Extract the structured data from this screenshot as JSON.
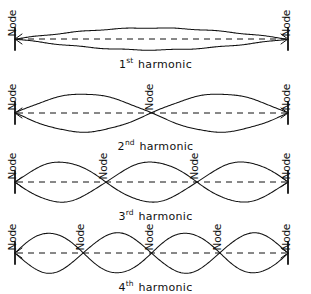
{
  "figure": {
    "background_color": "#ffffff",
    "ink_color": "#111111",
    "node_label_text": "Node"
  },
  "chart_data": {
    "type": "line",
    "xlabel": "",
    "ylabel": "",
    "xlim": [
      0,
      1
    ],
    "ylim": [
      -1,
      1
    ],
    "grid": false,
    "legend": "none",
    "annotations": [
      "Node",
      "1st harmonic",
      "2nd harmonic",
      "3rd harmonic",
      "4th harmonic"
    ],
    "series": [
      {
        "name": "1st harmonic",
        "harmonic_number": 1,
        "antinodes": 1,
        "nodes": 2,
        "node_positions_fraction": [
          0,
          1
        ],
        "amplitude_relative": 0.38,
        "waveform": "sin(1*pi*x)"
      },
      {
        "name": "2nd harmonic",
        "harmonic_number": 2,
        "antinodes": 2,
        "nodes": 3,
        "node_positions_fraction": [
          0,
          0.5,
          1
        ],
        "amplitude_relative": 0.82,
        "waveform": "sin(2*pi*x)"
      },
      {
        "name": "3rd harmonic",
        "harmonic_number": 3,
        "antinodes": 3,
        "nodes": 4,
        "node_positions_fraction": [
          0,
          0.3333,
          0.6667,
          1
        ],
        "amplitude_relative": 0.92,
        "waveform": "sin(3*pi*x)"
      },
      {
        "name": "4th harmonic",
        "harmonic_number": 4,
        "antinodes": 4,
        "nodes": 5,
        "node_positions_fraction": [
          0,
          0.25,
          0.5,
          0.75,
          1
        ],
        "amplitude_relative": 0.92,
        "waveform": "sin(4*pi*x)"
      }
    ]
  },
  "rows": [
    {
      "label_prefix": "1",
      "label_sup": "st",
      "label_word": "harmonic",
      "nodes": [
        {
          "text": "Node"
        },
        {
          "text": "Node"
        }
      ]
    },
    {
      "label_prefix": "2",
      "label_sup": "nd",
      "label_word": "harmonic",
      "nodes": [
        {
          "text": "Node"
        },
        {
          "text": "Node"
        },
        {
          "text": "Node"
        }
      ]
    },
    {
      "label_prefix": "3",
      "label_sup": "rd",
      "label_word": "harmonic",
      "nodes": [
        {
          "text": "Node"
        },
        {
          "text": "Node"
        },
        {
          "text": "Node"
        },
        {
          "text": "Node"
        }
      ]
    },
    {
      "label_prefix": "4",
      "label_sup": "th",
      "label_word": "harmonic",
      "nodes": [
        {
          "text": "Node"
        },
        {
          "text": "Node"
        },
        {
          "text": "Node"
        },
        {
          "text": "Node"
        },
        {
          "text": "Node"
        }
      ]
    }
  ]
}
